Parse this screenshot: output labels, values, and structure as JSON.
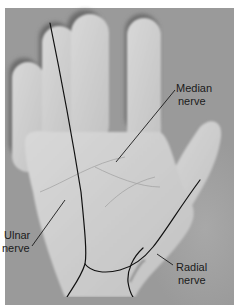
{
  "figure": {
    "colors": {
      "background": "#9c9c9c",
      "skin_light": "#d6d6d6",
      "skin_mid": "#c4c4c4",
      "shadow": "#6e6e6e",
      "line": "#111111",
      "label_text": "#1a1a1a",
      "border": "#ffffff"
    },
    "labels": {
      "median": {
        "line1": "Median",
        "line2": "nerve"
      },
      "ulnar": {
        "line1": "Ulnar",
        "line2": "nerve"
      },
      "radial": {
        "line1": "Radial",
        "line2": "nerve"
      }
    }
  }
}
